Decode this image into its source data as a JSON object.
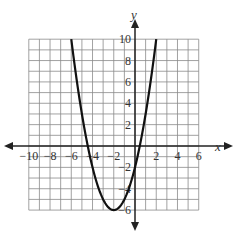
{
  "chart_data": {
    "type": "line",
    "title": "",
    "xlabel": "x",
    "ylabel": "y",
    "xlim": [
      -10,
      6
    ],
    "ylim": [
      -6,
      10
    ],
    "grid": true,
    "x_tick_labels": [
      "-10",
      "-8",
      "-6",
      "-4",
      "-2",
      "2",
      "4",
      "6"
    ],
    "y_tick_labels": [
      "10",
      "8",
      "6",
      "4",
      "2",
      "-2",
      "-4",
      "-6"
    ],
    "series": [
      {
        "name": "parabola",
        "equation": "y = (x + 2)^2 - 6",
        "vertex": [
          -2,
          -6
        ],
        "y_intercept": -2,
        "roots": [
          -4.45,
          0.45
        ],
        "x": [
          -6,
          -5,
          -4,
          -3,
          -2,
          -1,
          0,
          1,
          2
        ],
        "y": [
          10,
          3,
          -2,
          -5,
          -6,
          -5,
          -2,
          3,
          10
        ]
      }
    ],
    "colors": {
      "curve": "#111111",
      "grid": "#8a8a8a",
      "axis": "#222222"
    }
  }
}
